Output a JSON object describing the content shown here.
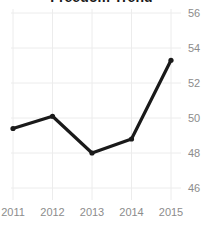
{
  "chart_data": {
    "type": "line",
    "title": "Freedom Trend",
    "xlabel": "",
    "ylabel": "",
    "categories": [
      "2011",
      "2012",
      "2013",
      "2014",
      "2015"
    ],
    "values": [
      49.4,
      50.1,
      48.0,
      48.8,
      53.3
    ],
    "series": [
      {
        "name": "Freedom Trend",
        "values": [
          49.4,
          50.1,
          48.0,
          48.8,
          53.3
        ]
      }
    ],
    "ylim": [
      45.2,
      56.6
    ],
    "yticks": [
      46,
      48,
      50,
      52,
      54,
      56
    ],
    "ytick_labels": [
      "46",
      "48",
      "50",
      "52",
      "54",
      "56"
    ],
    "xtick_labels": [
      "2011",
      "2012",
      "2013",
      "2014",
      "2015"
    ],
    "grid": true,
    "grid_axis": "both",
    "legend": false,
    "legend_position": "none",
    "y_axis_side": "right",
    "markers": "circle",
    "colors": {
      "line": "#1a1a1a",
      "marker": "#1a1a1a",
      "grid": "#ececec",
      "tick_label": "#8c8c8c",
      "title": "#1a1a1a",
      "background": "#ffffff"
    }
  }
}
